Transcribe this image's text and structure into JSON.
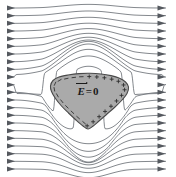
{
  "figure": {
    "name": "electrostatic-shielding-diagram",
    "background_color": "#ffffff",
    "width": 176,
    "height": 177
  },
  "label": {
    "symbol": "E",
    "equals": "=",
    "value": "0",
    "full_text": "E⃗ = 0",
    "color": "#1a1a1a"
  },
  "conductor": {
    "name": "conductor-body",
    "fill_color": "#aaaaaa",
    "stroke_color": "#4a4a4a",
    "shape": "rounded-triangular-blob",
    "interior_field": "0"
  },
  "field": {
    "name": "uniform-electric-field",
    "direction": "left-to-right",
    "line_color": "#6e7278",
    "arrow_color": "#55595f",
    "line_count": 22,
    "arrows_per_line": 2,
    "arrow_positions": [
      "left-margin",
      "right-margin"
    ]
  },
  "charges": {
    "negative_side": "left",
    "negative_symbol": "−",
    "negative_count": 13,
    "positive_side": "right",
    "positive_symbol": "+",
    "positive_count": 13,
    "color": "#2b2b2b"
  }
}
